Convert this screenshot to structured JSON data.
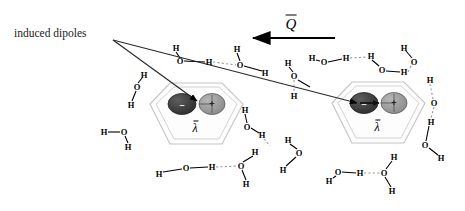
{
  "figure": {
    "title_label": "induced dipoles",
    "charge_symbol": "Q",
    "polarizability_symbol": "λ",
    "dipole_negative_sign": "–",
    "dipole_positive_sign": "+",
    "atom_oxygen": "O",
    "atom_hydrogen": "H",
    "colors": {
      "negative_lobe": "#3a3a3a",
      "positive_lobe": "#9a9a9a",
      "cage_outline": "#c9c9c9",
      "bond": "#000000",
      "hydrogen_bond": "#9b9b9b",
      "leader_line": "#2b2b2b"
    }
  },
  "cages": [
    {
      "name": "left-cage",
      "label": "λ",
      "cx": 196,
      "cy": 118,
      "dipole_arrow": "down-right"
    },
    {
      "name": "right-cage",
      "label": "λ",
      "cx": 378,
      "cy": 117,
      "dipole_arrow": "right"
    }
  ],
  "field_vector": {
    "symbol": "Q",
    "direction": "left",
    "x1": 335,
    "x2": 253,
    "y": 38
  },
  "atoms": [
    {
      "t": "H",
      "x": 176,
      "y": 48
    },
    {
      "t": "O",
      "x": 180,
      "y": 61
    },
    {
      "t": "H",
      "x": 209,
      "y": 62
    },
    {
      "t": "H",
      "x": 237,
      "y": 49
    },
    {
      "t": "O",
      "x": 240,
      "y": 65
    },
    {
      "t": "H",
      "x": 265,
      "y": 73
    },
    {
      "t": "H",
      "x": 144,
      "y": 75
    },
    {
      "t": "O",
      "x": 137,
      "y": 87
    },
    {
      "t": "H",
      "x": 131,
      "y": 105
    },
    {
      "t": "H",
      "x": 104,
      "y": 132
    },
    {
      "t": "O",
      "x": 124,
      "y": 132
    },
    {
      "t": "H",
      "x": 128,
      "y": 147
    },
    {
      "t": "H",
      "x": 159,
      "y": 174
    },
    {
      "t": "O",
      "x": 186,
      "y": 168
    },
    {
      "t": "H",
      "x": 212,
      "y": 167
    },
    {
      "t": "O",
      "x": 241,
      "y": 166
    },
    {
      "t": "H",
      "x": 255,
      "y": 152
    },
    {
      "t": "H",
      "x": 246,
      "y": 184
    },
    {
      "t": "H",
      "x": 245,
      "y": 110
    },
    {
      "t": "O",
      "x": 247,
      "y": 127
    },
    {
      "t": "H",
      "x": 262,
      "y": 135
    },
    {
      "t": "H",
      "x": 288,
      "y": 63
    },
    {
      "t": "O",
      "x": 294,
      "y": 76
    },
    {
      "t": "H",
      "x": 294,
      "y": 96
    },
    {
      "t": "O",
      "x": 299,
      "y": 153
    },
    {
      "t": "H",
      "x": 288,
      "y": 140
    },
    {
      "t": "H",
      "x": 283,
      "y": 170
    },
    {
      "t": "H",
      "x": 312,
      "y": 58
    },
    {
      "t": "O",
      "x": 324,
      "y": 62
    },
    {
      "t": "H",
      "x": 346,
      "y": 58
    },
    {
      "t": "H",
      "x": 371,
      "y": 56
    },
    {
      "t": "O",
      "x": 382,
      "y": 70
    },
    {
      "t": "H",
      "x": 404,
      "y": 72
    },
    {
      "t": "H",
      "x": 329,
      "y": 181
    },
    {
      "t": "O",
      "x": 338,
      "y": 172
    },
    {
      "t": "H",
      "x": 360,
      "y": 173
    },
    {
      "t": "O",
      "x": 384,
      "y": 173
    },
    {
      "t": "H",
      "x": 394,
      "y": 157
    },
    {
      "t": "H",
      "x": 392,
      "y": 191
    },
    {
      "t": "H",
      "x": 430,
      "y": 80
    },
    {
      "t": "O",
      "x": 434,
      "y": 103
    },
    {
      "t": "H",
      "x": 431,
      "y": 122
    },
    {
      "t": "O",
      "x": 425,
      "y": 145
    },
    {
      "t": "H",
      "x": 441,
      "y": 158
    },
    {
      "t": "O",
      "x": 414,
      "y": 62
    },
    {
      "t": "H",
      "x": 404,
      "y": 48
    }
  ],
  "bonds": [
    {
      "x1": 176,
      "y1": 52,
      "x2": 180,
      "y2": 58,
      "type": "covalent"
    },
    {
      "x1": 184,
      "y1": 61,
      "x2": 205,
      "y2": 62,
      "type": "covalent"
    },
    {
      "x1": 213,
      "y1": 62,
      "x2": 236,
      "y2": 65,
      "type": "hbond"
    },
    {
      "x1": 237,
      "y1": 53,
      "x2": 240,
      "y2": 61,
      "type": "covalent"
    },
    {
      "x1": 244,
      "y1": 66,
      "x2": 262,
      "y2": 71,
      "type": "covalent"
    },
    {
      "x1": 142,
      "y1": 78,
      "x2": 138,
      "y2": 83,
      "type": "covalent"
    },
    {
      "x1": 136,
      "y1": 91,
      "x2": 132,
      "y2": 101,
      "type": "covalent"
    },
    {
      "x1": 108,
      "y1": 132,
      "x2": 120,
      "y2": 132,
      "type": "covalent"
    },
    {
      "x1": 125,
      "y1": 136,
      "x2": 128,
      "y2": 143,
      "type": "covalent"
    },
    {
      "x1": 163,
      "y1": 172,
      "x2": 182,
      "y2": 169,
      "type": "covalent"
    },
    {
      "x1": 190,
      "y1": 168,
      "x2": 208,
      "y2": 167,
      "type": "covalent"
    },
    {
      "x1": 216,
      "y1": 167,
      "x2": 237,
      "y2": 166,
      "type": "hbond"
    },
    {
      "x1": 243,
      "y1": 162,
      "x2": 253,
      "y2": 156,
      "type": "covalent"
    },
    {
      "x1": 242,
      "y1": 170,
      "x2": 246,
      "y2": 180,
      "type": "covalent"
    },
    {
      "x1": 245,
      "y1": 114,
      "x2": 247,
      "y2": 123,
      "type": "covalent"
    },
    {
      "x1": 251,
      "y1": 128,
      "x2": 259,
      "y2": 133,
      "type": "covalent"
    },
    {
      "x1": 289,
      "y1": 67,
      "x2": 293,
      "y2": 72,
      "type": "covalent"
    },
    {
      "x1": 294,
      "y1": 80,
      "x2": 294,
      "y2": 92,
      "type": "hbond"
    },
    {
      "x1": 297,
      "y1": 149,
      "x2": 290,
      "y2": 144,
      "type": "covalent"
    },
    {
      "x1": 296,
      "y1": 157,
      "x2": 286,
      "y2": 166,
      "type": "covalent"
    },
    {
      "x1": 316,
      "y1": 60,
      "x2": 320,
      "y2": 61,
      "type": "covalent"
    },
    {
      "x1": 328,
      "y1": 62,
      "x2": 342,
      "y2": 59,
      "type": "covalent"
    },
    {
      "x1": 350,
      "y1": 58,
      "x2": 367,
      "y2": 57,
      "type": "hbond"
    },
    {
      "x1": 372,
      "y1": 60,
      "x2": 379,
      "y2": 66,
      "type": "covalent"
    },
    {
      "x1": 386,
      "y1": 71,
      "x2": 400,
      "y2": 72,
      "type": "covalent"
    },
    {
      "x1": 333,
      "y1": 178,
      "x2": 336,
      "y2": 176,
      "type": "covalent"
    },
    {
      "x1": 342,
      "y1": 172,
      "x2": 356,
      "y2": 173,
      "type": "covalent"
    },
    {
      "x1": 364,
      "y1": 173,
      "x2": 380,
      "y2": 173,
      "type": "hbond"
    },
    {
      "x1": 386,
      "y1": 169,
      "x2": 392,
      "y2": 161,
      "type": "covalent"
    },
    {
      "x1": 385,
      "y1": 177,
      "x2": 391,
      "y2": 187,
      "type": "covalent"
    },
    {
      "x1": 430,
      "y1": 84,
      "x2": 433,
      "y2": 99,
      "type": "hbond"
    },
    {
      "x1": 434,
      "y1": 107,
      "x2": 431,
      "y2": 118,
      "type": "hbond"
    },
    {
      "x1": 429,
      "y1": 126,
      "x2": 426,
      "y2": 141,
      "type": "covalent"
    },
    {
      "x1": 429,
      "y1": 148,
      "x2": 438,
      "y2": 155,
      "type": "covalent"
    },
    {
      "x1": 412,
      "y1": 58,
      "x2": 406,
      "y2": 51,
      "type": "covalent"
    },
    {
      "x1": 408,
      "y1": 72,
      "x2": 411,
      "y2": 66,
      "type": "hbond"
    },
    {
      "x1": 298,
      "y1": 80,
      "x2": 310,
      "y2": 87,
      "type": "covalent"
    },
    {
      "x1": 264,
      "y1": 139,
      "x2": 270,
      "y2": 146,
      "type": "hbond"
    }
  ],
  "leader_lines": [
    {
      "name": "leader-to-left-cage",
      "x1": 113,
      "y1": 40,
      "x2": 197,
      "y2": 101
    },
    {
      "name": "leader-to-right-cage",
      "x1": 113,
      "y1": 40,
      "x2": 357,
      "y2": 103
    }
  ]
}
